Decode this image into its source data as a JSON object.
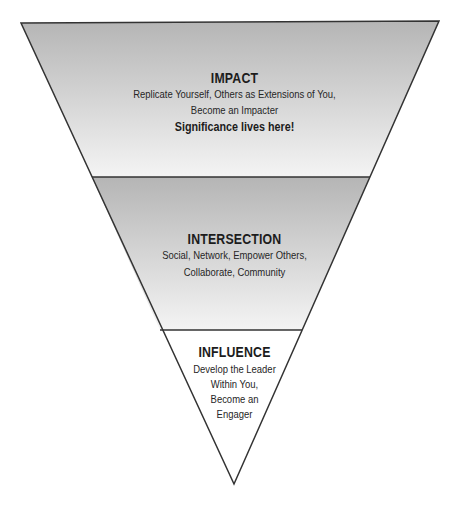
{
  "diagram": {
    "type": "inverted-pyramid",
    "colors": {
      "outline": "#333333",
      "band_top": "#b5b5b5",
      "band_bottom": "#f4f4f4",
      "bottom_fill": "#ffffff",
      "text": "#1c1c1c"
    },
    "levels": [
      {
        "title": "IMPACT",
        "lines": [
          "Replicate Yourself, Others as Extensions of You,",
          "Become an Impacter"
        ],
        "emphasis": "Significance lives here!"
      },
      {
        "title": "INTERSECTION",
        "lines": [
          "Social, Network, Empower Others,",
          "Collaborate, Community"
        ]
      },
      {
        "title": "INFLUENCE",
        "lines": [
          "Develop the Leader",
          "Within You,",
          "Become an",
          "Engager"
        ]
      }
    ]
  }
}
